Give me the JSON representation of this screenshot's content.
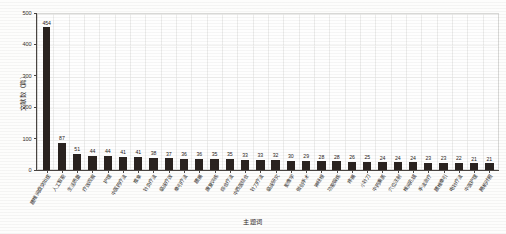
{
  "chart_data": {
    "type": "bar",
    "title": "",
    "xlabel": "主题词",
    "ylabel": "文献数（篇）",
    "ylim": [
      0,
      500
    ],
    "yticks": [
      0,
      100,
      200,
      300,
      400,
      500
    ],
    "ytick_labels": [
      "0",
      "100",
      "200",
      "300",
      "400",
      "500"
    ],
    "grid": true,
    "legend": "none",
    "bar_color": "#2a2320",
    "categories": [
      "腰椎间盘突出症",
      "人工智能",
      "生活质量",
      "疗效观察",
      "护理",
      "中医药疗法",
      "推拿",
      "针灸疗法",
      "临床疗效",
      "牵引疗法",
      "腰痛",
      "康复训练",
      "综合疗法",
      "中西医结合",
      "针刀疗法",
      "临床研究",
      "影像学",
      "微创手术",
      "神经根",
      "功能锻炼",
      "疼痛",
      "小针刀",
      "中药熏蒸",
      "穴位注射",
      "椎间孔镜",
      "手法治疗",
      "腰椎牵引",
      "电针疗法",
      "中医护理",
      "随机对照"
    ],
    "values": [
      454,
      87,
      51,
      44,
      44,
      41,
      41,
      38,
      37,
      36,
      36,
      35,
      35,
      33,
      33,
      32,
      30,
      29,
      28,
      28,
      26,
      25,
      24,
      24,
      24,
      23,
      23,
      22,
      21,
      21
    ],
    "value_labels": [
      "454",
      "87",
      "51",
      "44",
      "44",
      "41",
      "41",
      "38",
      "37",
      "36",
      "36",
      "35",
      "35",
      "33",
      "33",
      "32",
      "30",
      "29",
      "28",
      "28",
      "26",
      "25",
      "24",
      "24",
      "24",
      "23",
      "23",
      "22",
      "21",
      "21"
    ]
  }
}
